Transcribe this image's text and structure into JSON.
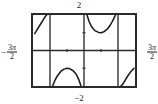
{
  "figure": {
    "kind": "math-function-graph",
    "top_label": "2",
    "bottom_label": "−2",
    "left_label": {
      "sign": "−",
      "numerator_coeff": "3",
      "numerator_symbol": "π",
      "denominator": "2",
      "text": "−3π/2"
    },
    "right_label": {
      "sign": "",
      "numerator_coeff": "3",
      "numerator_symbol": "π",
      "denominator": "2",
      "text": "3π/2"
    },
    "frame_color": "#2b2b2b",
    "curve_color": "#1a1a1a",
    "axis_color": "#2b2b2b"
  },
  "chart_data": {
    "type": "line",
    "title": "",
    "xlabel": "",
    "ylabel": "",
    "xlim": [
      -4.71238898038469,
      4.71238898038469
    ],
    "ylim": [
      -2,
      2
    ],
    "xlim_labels": [
      "−3π/2",
      "3π/2"
    ],
    "ylim_labels": [
      "−2",
      "2"
    ],
    "grid": false,
    "legend": null,
    "x_tick_values": [
      -3.141592653589793,
      -1.570796326794897,
      0,
      1.570796326794897,
      3.141592653589793
    ],
    "x_tick_labels": [
      "",
      "",
      "",
      "",
      ""
    ],
    "asymptotes_x": [
      -3.141592653589793,
      0,
      3.141592653589793
    ],
    "asymptote_pixels_fraction": [
      0.3333,
      0.5,
      0.6667
    ],
    "branches": [
      {
        "name": "branch-upper-left",
        "quadrant": "top-left",
        "description": "increasing curve rising toward the left asymptote at x = -π, entering from the bottom-left of the frame",
        "points": [
          [
            -4.55,
            0.95
          ],
          [
            -4.3,
            1.2
          ],
          [
            -4.05,
            1.45
          ],
          [
            -3.8,
            1.7
          ],
          [
            -3.6,
            1.9
          ],
          [
            -3.45,
            2.0
          ]
        ]
      },
      {
        "name": "branch-upper-middle",
        "quadrant": "top-middle-right",
        "description": "U-shaped branch between the asymptotes at x = 0 and x = π with minimum of about 1 at x = π/2",
        "points": [
          [
            0.28,
            2.0
          ],
          [
            0.48,
            1.62
          ],
          [
            0.72,
            1.32
          ],
          [
            1.0,
            1.12
          ],
          [
            1.35,
            1.02
          ],
          [
            1.57,
            1.0
          ],
          [
            1.85,
            1.06
          ],
          [
            2.15,
            1.2
          ],
          [
            2.45,
            1.45
          ],
          [
            2.72,
            1.75
          ],
          [
            2.9,
            2.0
          ]
        ]
      },
      {
        "name": "branch-lower-middle",
        "quadrant": "bottom-middle-left",
        "description": "inverted U (arch) branch between the asymptotes at x = -π and x = 0 with maximum of about -1 at x = -π/2",
        "points": [
          [
            -2.9,
            -2.0
          ],
          [
            -2.7,
            -1.7
          ],
          [
            -2.45,
            -1.42
          ],
          [
            -2.15,
            -1.18
          ],
          [
            -1.85,
            -1.05
          ],
          [
            -1.57,
            -1.0
          ],
          [
            -1.3,
            -1.03
          ],
          [
            -1.0,
            -1.14
          ],
          [
            -0.72,
            -1.34
          ],
          [
            -0.48,
            -1.64
          ],
          [
            -0.28,
            -2.0
          ]
        ]
      },
      {
        "name": "branch-lower-right",
        "quadrant": "bottom-right",
        "description": "increasing curve leaving the asymptote at x = π and rising toward the right edge of the frame",
        "points": [
          [
            3.42,
            -2.0
          ],
          [
            3.6,
            -1.88
          ],
          [
            3.85,
            -1.62
          ],
          [
            4.1,
            -1.38
          ],
          [
            4.38,
            -1.15
          ],
          [
            4.62,
            -1.0
          ]
        ]
      }
    ]
  }
}
